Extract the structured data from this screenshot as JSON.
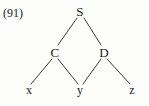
{
  "figure": {
    "example_number": "(91)",
    "background_color": "#fdfdfc",
    "ink_color": "#1b1b1b",
    "edge_color": "#3a3a3a",
    "width": 149,
    "height": 106
  },
  "tree": {
    "type": "syntax-tree",
    "nodes": [
      {
        "id": "S",
        "label": "S",
        "x": 80,
        "y": 11,
        "kind": "nonterminal"
      },
      {
        "id": "C",
        "label": "C",
        "x": 55,
        "y": 52,
        "kind": "nonterminal"
      },
      {
        "id": "D",
        "label": "D",
        "x": 104,
        "y": 52,
        "kind": "nonterminal"
      },
      {
        "id": "x",
        "label": "x",
        "x": 29,
        "y": 90,
        "kind": "terminal"
      },
      {
        "id": "y",
        "label": "y",
        "x": 80,
        "y": 90,
        "kind": "terminal"
      },
      {
        "id": "z",
        "label": "z",
        "x": 132,
        "y": 90,
        "kind": "terminal"
      }
    ],
    "edges": [
      {
        "from": "S",
        "to": "C",
        "x1": 77,
        "y1": 18,
        "x2": 58,
        "y2": 45
      },
      {
        "from": "S",
        "to": "D",
        "x1": 84,
        "y1": 18,
        "x2": 101,
        "y2": 45
      },
      {
        "from": "C",
        "to": "x",
        "x1": 52,
        "y1": 59,
        "x2": 31,
        "y2": 84
      },
      {
        "from": "C",
        "to": "y",
        "x1": 58,
        "y1": 59,
        "x2": 78,
        "y2": 84
      },
      {
        "from": "D",
        "to": "y",
        "x1": 101,
        "y1": 59,
        "x2": 83,
        "y2": 84
      },
      {
        "from": "D",
        "to": "z",
        "x1": 107,
        "y1": 59,
        "x2": 130,
        "y2": 84
      }
    ]
  }
}
